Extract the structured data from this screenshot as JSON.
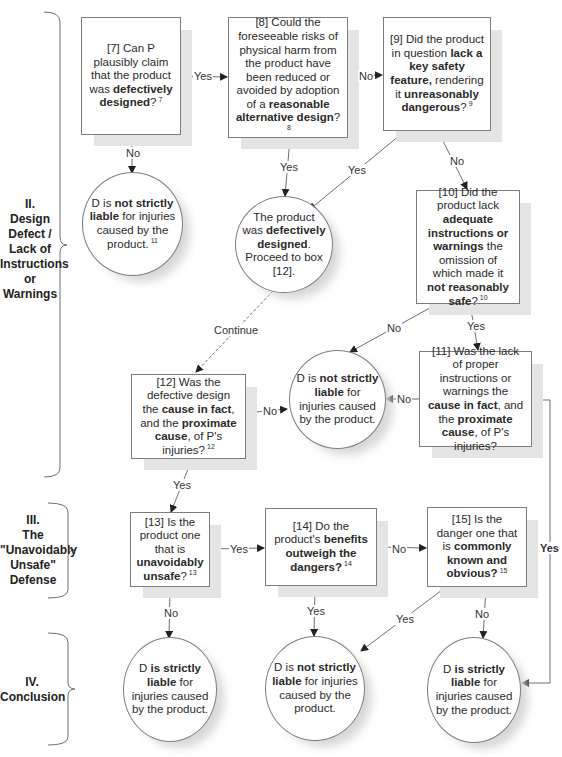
{
  "sections": [
    {
      "id": "II",
      "label_lines": [
        "II.",
        "Design",
        "Defect /",
        "Lack of",
        "Instructions",
        "or",
        "Warnings"
      ]
    },
    {
      "id": "III",
      "label_lines": [
        "III.",
        "The",
        "\"Unavoidably",
        "Unsafe\"",
        "Defense"
      ]
    },
    {
      "id": "IV",
      "label_lines": [
        "IV.",
        "Conclusion"
      ]
    }
  ],
  "nodes": {
    "box7": {
      "parts": [
        {
          "t": "[7] Can P plausibly claim that the product was "
        },
        {
          "t": "defectively designed",
          "b": true
        },
        {
          "t": "?"
        }
      ],
      "footnote": "7"
    },
    "box8": {
      "parts": [
        {
          "t": "[8] Could the foreseeable risks of physical harm from the product have been reduced or avoided by adoption of a "
        },
        {
          "t": "reasonable alternative design",
          "b": true
        },
        {
          "t": "?"
        }
      ],
      "footnote": "8"
    },
    "box9": {
      "parts": [
        {
          "t": "[9] Did the product in question "
        },
        {
          "t": "lack a key safety feature,",
          "b": true
        },
        {
          "t": " rendering it "
        },
        {
          "t": "unreasonably dangerous",
          "b": true
        },
        {
          "t": "?"
        }
      ],
      "footnote": "9"
    },
    "circ_not_liable_11": {
      "parts": [
        {
          "t": "D is "
        },
        {
          "t": "not strictly liable",
          "b": true
        },
        {
          "t": " for injuries caused by the product."
        }
      ],
      "footnote": "11"
    },
    "circ_defective": {
      "parts": [
        {
          "t": "The product was "
        },
        {
          "t": "defectively designed",
          "b": true
        },
        {
          "t": ". Proceed to box [12]."
        }
      ]
    },
    "box10": {
      "parts": [
        {
          "t": "[10] Did the product lack "
        },
        {
          "t": "adequate instructions or warnings",
          "b": true
        },
        {
          "t": " the omission of which made it "
        },
        {
          "t": "not reasonably safe",
          "b": true
        },
        {
          "t": "?"
        }
      ],
      "footnote": "10"
    },
    "circ_not_liable_mid": {
      "parts": [
        {
          "t": "D is "
        },
        {
          "t": "not strictly liable",
          "b": true
        },
        {
          "t": " for injuries caused by the product."
        }
      ]
    },
    "box11": {
      "parts": [
        {
          "t": "[11] Was the lack of proper instructions or warnings the "
        },
        {
          "t": "cause in fact",
          "b": true
        },
        {
          "t": ", and the "
        },
        {
          "t": "proximate cause",
          "b": true
        },
        {
          "t": ", of P's injuries?"
        }
      ]
    },
    "box12": {
      "parts": [
        {
          "t": "[12] Was the defective design the "
        },
        {
          "t": "cause in fact",
          "b": true
        },
        {
          "t": ", and the "
        },
        {
          "t": "proximate cause",
          "b": true
        },
        {
          "t": ", of P's injuries?"
        }
      ],
      "footnote": "12"
    },
    "box13": {
      "parts": [
        {
          "t": "[13] Is the product one that is "
        },
        {
          "t": "unavoidably unsafe",
          "b": true
        },
        {
          "t": "?"
        }
      ],
      "footnote": "13"
    },
    "box14": {
      "parts": [
        {
          "t": "[14] Do the product's "
        },
        {
          "t": "benefits outweigh the dangers?",
          "b": true
        }
      ],
      "footnote": "14"
    },
    "box15": {
      "parts": [
        {
          "t": "[15] Is the danger one that is "
        },
        {
          "t": "commonly known and obvious?",
          "b": true
        }
      ],
      "footnote": "15"
    },
    "circ_liable_left": {
      "parts": [
        {
          "t": "D "
        },
        {
          "t": "is strictly liable",
          "b": true
        },
        {
          "t": " for injuries caused by the product."
        }
      ]
    },
    "circ_not_liable_bottom": {
      "parts": [
        {
          "t": "D is "
        },
        {
          "t": "not strictly liable",
          "b": true
        },
        {
          "t": " for injuries caused by the product."
        }
      ]
    },
    "circ_liable_right": {
      "parts": [
        {
          "t": "D "
        },
        {
          "t": "is strictly liable",
          "b": true
        },
        {
          "t": " for injuries caused by the product."
        }
      ]
    }
  },
  "edge_labels": {
    "box7_to_box8": "Yes",
    "box7_to_circ11": "No",
    "box8_to_box9": "No",
    "box8_to_defective": "Yes",
    "box9_to_defective": "Yes",
    "box9_to_box10": "No",
    "defective_to_box12": "Continue",
    "box10_to_notliable": "No",
    "box10_to_box11": "Yes",
    "box11_to_notliable": "No",
    "box12_to_notliable": "No",
    "box12_to_box13": "Yes",
    "box13_to_box14": "Yes",
    "box13_to_liable": "No",
    "box14_to_box15": "No",
    "box14_to_notliable": "Yes",
    "box15_to_notliable": "Yes",
    "box15_to_liable": "No",
    "box11_to_liable_right": "Yes"
  },
  "colors": {
    "line": "#6f6f6f",
    "border": "#7d7d7d",
    "shadow": "#e4e4e4",
    "text": "#2a2a2a"
  }
}
